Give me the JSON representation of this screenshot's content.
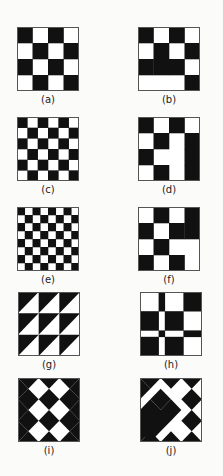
{
  "figures": [
    {
      "id": "a",
      "label": "(a)",
      "kind": "grid",
      "rows": [
        [
          1,
          0,
          1,
          0
        ],
        [
          0,
          1,
          0,
          1
        ],
        [
          1,
          0,
          1,
          0
        ],
        [
          0,
          1,
          0,
          1
        ]
      ]
    },
    {
      "id": "b",
      "label": "(b)",
      "kind": "grid",
      "rows": [
        [
          1,
          0,
          1,
          0
        ],
        [
          0,
          1,
          0,
          1
        ],
        [
          1,
          1,
          1,
          0
        ],
        [
          0,
          0,
          0,
          1
        ]
      ]
    },
    {
      "id": "c",
      "label": "(c)",
      "kind": "checker",
      "n": 6
    },
    {
      "id": "d",
      "label": "(d)",
      "kind": "grid",
      "rows": [
        [
          1,
          0,
          1,
          0
        ],
        [
          0,
          1,
          0,
          1
        ],
        [
          1,
          0,
          0,
          1
        ],
        [
          0,
          1,
          0,
          1
        ]
      ]
    },
    {
      "id": "e",
      "label": "(e)",
      "kind": "checker",
      "n": 8
    },
    {
      "id": "f",
      "label": "(f)",
      "kind": "grid",
      "rows": [
        [
          0,
          1,
          0,
          1
        ],
        [
          1,
          0,
          1,
          1
        ],
        [
          0,
          1,
          0,
          0
        ],
        [
          1,
          0,
          1,
          0
        ]
      ]
    },
    {
      "id": "g",
      "label": "(g)",
      "kind": "triangles",
      "n": 3
    },
    {
      "id": "h",
      "label": "(h)",
      "kind": "irregular-grid",
      "rows": [
        [
          0,
          1,
          0,
          1
        ],
        [
          1,
          0,
          1,
          0
        ],
        [
          0,
          1,
          0,
          1
        ],
        [
          1,
          0,
          1,
          0
        ]
      ],
      "col_weights": [
        3,
        1,
        3,
        3
      ],
      "row_weights": [
        3,
        3,
        1,
        3
      ]
    },
    {
      "id": "i",
      "label": "(i)",
      "kind": "diamonds",
      "n": 3
    },
    {
      "id": "j",
      "label": "(j)",
      "kind": "diamonds-variant",
      "n": 3
    }
  ],
  "colors": {
    "ink": "#111111",
    "paper": "#ffffff",
    "border": "#555555"
  }
}
